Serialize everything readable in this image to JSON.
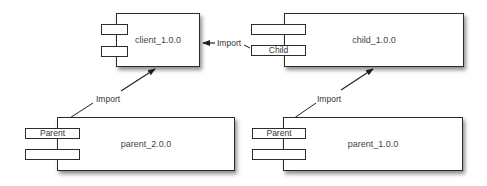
{
  "diagram": {
    "type": "component-dependency",
    "components": [
      {
        "id": "client",
        "label": "client_1.0.0",
        "ports": [
          "",
          ""
        ]
      },
      {
        "id": "child",
        "label": "child_1.0.0",
        "ports": [
          "",
          "Child"
        ]
      },
      {
        "id": "parent2",
        "label": "parent_2.0.0",
        "ports": [
          "Parent",
          ""
        ]
      },
      {
        "id": "parent1",
        "label": "parent_1.0.0",
        "ports": [
          "Parent",
          ""
        ]
      }
    ],
    "edges": [
      {
        "from": "child.Child",
        "to": "client",
        "label": "Import"
      },
      {
        "from": "parent2.Parent",
        "to": "client",
        "label": "Import"
      },
      {
        "from": "parent1.Parent",
        "to": "child",
        "label": "Import"
      }
    ],
    "colors": {
      "stroke": "#2b2b2b",
      "text": "#444444",
      "background": "#ffffff"
    }
  }
}
